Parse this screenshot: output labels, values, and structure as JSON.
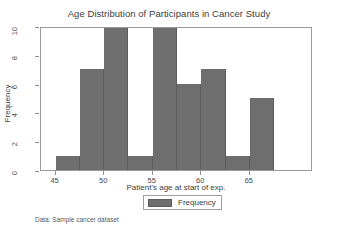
{
  "chart_data": {
    "type": "bar",
    "title": "Age Distribution of Participants in Cancer Study",
    "xlabel": "Patient's age at start of exp.",
    "ylabel": "Frequency",
    "categories": [
      "45-47.5",
      "47.5-50",
      "50-52.5",
      "52.5-55",
      "55-57.5",
      "57.5-60",
      "60-62.5",
      "62.5-65",
      "65-67.5"
    ],
    "bin_starts": [
      45,
      47.5,
      50,
      52.5,
      55,
      57.5,
      60,
      62.5,
      65
    ],
    "bin_width": 2.5,
    "values": [
      1,
      7,
      10,
      1,
      10,
      6,
      7,
      1,
      5
    ],
    "xlim": [
      43.5,
      71.5
    ],
    "ylim": [
      0,
      10
    ],
    "xticks": [
      45,
      50,
      55,
      60,
      65
    ],
    "xtick_labels": [
      "45",
      "50",
      "55",
      "60",
      "65"
    ],
    "yticks": [
      0,
      2,
      4,
      6,
      8,
      10
    ],
    "ytick_labels": [
      "0",
      "2",
      "4",
      "6",
      "8",
      "10"
    ],
    "grid": false,
    "legend_position": "bottom-center",
    "series_name": "Frequency",
    "bar_color": "#6e6e6e",
    "bar_edge_color": "#5c5c5c",
    "frame_color": "#9a9a9a",
    "caption": "Data: Sample cancer dataset"
  }
}
